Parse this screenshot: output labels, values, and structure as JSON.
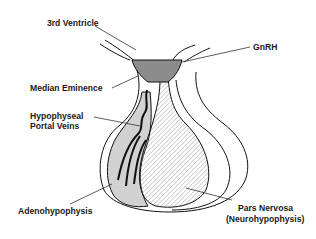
{
  "diagram": {
    "labels": {
      "third_ventricle": "3rd Ventricle",
      "gnrh": "GnRH",
      "median_eminence": "Median Eminence",
      "portal_veins_line1": "Hypophyseal",
      "portal_veins_line2": "Portal Veins",
      "adenohypophysis": "Adenohypophysis",
      "pars_nervosa_line1": "Pars Nervosa",
      "pars_nervosa_line2": "(Neurohypophysis)"
    },
    "colors": {
      "outline": "#111111",
      "median_eminence_fill": "#8c8c8c",
      "adenohypophysis_fill": "#d4d4d4",
      "hatch": "#9a9a9a",
      "leader_line": "#333333",
      "background": "#ffffff"
    }
  }
}
